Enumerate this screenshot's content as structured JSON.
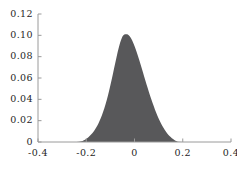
{
  "chart_data": {
    "type": "area",
    "title": "",
    "subtitle": "",
    "xlabel": "",
    "ylabel": "",
    "xlim": [
      -0.4,
      0.4
    ],
    "ylim": [
      0.0,
      0.12
    ],
    "grid": false,
    "legend": null,
    "legend_position": "none",
    "fill_color": "#58585a",
    "axis_color": "#9a9a9a",
    "text_color": "#262626",
    "background_color": "#ffffff",
    "xticks": [
      -0.4,
      -0.2,
      0,
      0.2,
      0.4
    ],
    "xtick_labels": [
      "-0.4",
      "-0.2",
      "0",
      "0.2",
      "0.4"
    ],
    "yticks": [
      0,
      0.02,
      0.04,
      0.06,
      0.08,
      0.1,
      0.12
    ],
    "ytick_labels": [
      "0",
      "0.02",
      "0.04",
      "0.06",
      "0.08",
      "0.10",
      "0.12"
    ],
    "peak": {
      "x": -0.03,
      "y": 0.101
    },
    "support": [
      -0.225,
      0.175
    ],
    "x": [
      -0.4,
      -0.38,
      -0.36,
      -0.34,
      -0.32,
      -0.3,
      -0.28,
      -0.26,
      -0.24,
      -0.23,
      -0.22,
      -0.215,
      -0.21,
      -0.205,
      -0.2,
      -0.195,
      -0.19,
      -0.185,
      -0.18,
      -0.175,
      -0.17,
      -0.165,
      -0.16,
      -0.155,
      -0.15,
      -0.145,
      -0.14,
      -0.135,
      -0.13,
      -0.125,
      -0.12,
      -0.115,
      -0.11,
      -0.105,
      -0.1,
      -0.095,
      -0.09,
      -0.085,
      -0.08,
      -0.075,
      -0.07,
      -0.065,
      -0.06,
      -0.055,
      -0.05,
      -0.045,
      -0.04,
      -0.035,
      -0.03,
      -0.025,
      -0.02,
      -0.015,
      -0.01,
      -0.005,
      0.0,
      0.005,
      0.01,
      0.015,
      0.02,
      0.025,
      0.03,
      0.035,
      0.04,
      0.045,
      0.05,
      0.055,
      0.06,
      0.065,
      0.07,
      0.075,
      0.08,
      0.085,
      0.09,
      0.095,
      0.1,
      0.105,
      0.11,
      0.115,
      0.12,
      0.125,
      0.13,
      0.135,
      0.14,
      0.145,
      0.15,
      0.155,
      0.16,
      0.165,
      0.17,
      0.175,
      0.18,
      0.2,
      0.22,
      0.25,
      0.3,
      0.35,
      0.4
    ],
    "values": [
      0.0,
      0.0,
      0.0,
      0.0,
      0.0,
      0.0,
      0.0,
      0.0,
      0.0,
      0.0002,
      0.0006,
      0.001,
      0.0016,
      0.0022,
      0.003,
      0.0038,
      0.0048,
      0.0058,
      0.007,
      0.0083,
      0.0097,
      0.0113,
      0.0131,
      0.015,
      0.0172,
      0.0196,
      0.0222,
      0.0251,
      0.0283,
      0.0317,
      0.0354,
      0.0394,
      0.0437,
      0.0483,
      0.0531,
      0.0581,
      0.0633,
      0.0686,
      0.0739,
      0.0791,
      0.0841,
      0.0887,
      0.0928,
      0.0962,
      0.0988,
      0.1003,
      0.101,
      0.1011,
      0.101,
      0.1004,
      0.0992,
      0.0975,
      0.0954,
      0.0929,
      0.0901,
      0.087,
      0.0837,
      0.0802,
      0.0766,
      0.0729,
      0.0691,
      0.0653,
      0.0615,
      0.0577,
      0.054,
      0.0503,
      0.0467,
      0.0432,
      0.0398,
      0.0365,
      0.0334,
      0.0303,
      0.0274,
      0.0247,
      0.0221,
      0.0197,
      0.0174,
      0.0153,
      0.0133,
      0.0115,
      0.0098,
      0.0083,
      0.0069,
      0.0057,
      0.0046,
      0.0036,
      0.0027,
      0.0019,
      0.0012,
      0.0006,
      0.0002,
      0.0,
      0.0,
      0.0,
      0.0,
      0.0,
      0.0
    ]
  }
}
